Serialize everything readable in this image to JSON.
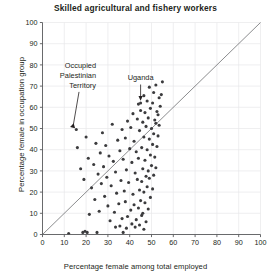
{
  "chart_data": {
    "type": "scatter",
    "title": "Skilled agricultural and fishery workers",
    "xlabel": "Percentage female among total employed",
    "ylabel": "Percentage female in occupation group",
    "xlim": [
      0,
      100
    ],
    "ylim": [
      0,
      100
    ],
    "xticks": [
      0,
      10,
      20,
      30,
      40,
      50,
      60,
      70,
      80,
      90,
      100
    ],
    "yticks": [
      0,
      10,
      20,
      30,
      40,
      50,
      60,
      70,
      80,
      90,
      100
    ],
    "grid": true,
    "legend": "none",
    "reference_line": {
      "type": "identity",
      "label": "y = x",
      "from": [
        0,
        0
      ],
      "to": [
        100,
        100
      ]
    },
    "annotations": [
      {
        "label": "Occupied Palestinian Territory",
        "lines": [
          "Occupied",
          "Palestinian",
          "Territory"
        ],
        "point": [
          15.5,
          49.5
        ],
        "leader": "arrow-down-right"
      },
      {
        "label": "Uganda",
        "lines": [
          "Uganda"
        ],
        "point": [
          45.0,
          62.0
        ],
        "leader": "arrow-down"
      }
    ],
    "points": [
      [
        15.5,
        49.5
      ],
      [
        45.0,
        62.0
      ],
      [
        12.0,
        0.5
      ],
      [
        18.5,
        1.0
      ],
      [
        19.5,
        1.5
      ],
      [
        20.5,
        1.0
      ],
      [
        25.0,
        1.0
      ],
      [
        37.0,
        1.0
      ],
      [
        33.5,
        3.5
      ],
      [
        35.5,
        4.0
      ],
      [
        38.5,
        3.0
      ],
      [
        41.0,
        5.0
      ],
      [
        42.5,
        3.5
      ],
      [
        44.5,
        4.5
      ],
      [
        46.5,
        2.5
      ],
      [
        31.0,
        6.5
      ],
      [
        36.5,
        7.5
      ],
      [
        39.0,
        8.5
      ],
      [
        43.0,
        7.0
      ],
      [
        45.5,
        9.0
      ],
      [
        47.5,
        6.0
      ],
      [
        21.5,
        9.5
      ],
      [
        26.0,
        11.0
      ],
      [
        33.0,
        10.5
      ],
      [
        40.5,
        11.5
      ],
      [
        44.0,
        12.5
      ],
      [
        46.0,
        10.0
      ],
      [
        48.5,
        12.0
      ],
      [
        30.0,
        13.5
      ],
      [
        35.0,
        14.5
      ],
      [
        38.0,
        15.5
      ],
      [
        42.0,
        14.0
      ],
      [
        45.0,
        16.0
      ],
      [
        47.0,
        15.0
      ],
      [
        49.5,
        17.5
      ],
      [
        24.0,
        16.5
      ],
      [
        28.5,
        18.0
      ],
      [
        34.0,
        19.5
      ],
      [
        37.5,
        20.5
      ],
      [
        41.5,
        19.0
      ],
      [
        44.5,
        21.0
      ],
      [
        46.5,
        20.0
      ],
      [
        48.0,
        22.5
      ],
      [
        50.5,
        21.5
      ],
      [
        22.5,
        22.0
      ],
      [
        27.0,
        24.0
      ],
      [
        31.5,
        23.0
      ],
      [
        36.0,
        25.5
      ],
      [
        39.5,
        24.5
      ],
      [
        43.5,
        26.0
      ],
      [
        45.5,
        25.0
      ],
      [
        47.5,
        27.5
      ],
      [
        49.0,
        26.5
      ],
      [
        51.0,
        28.0
      ],
      [
        19.0,
        26.0
      ],
      [
        25.5,
        28.5
      ],
      [
        29.5,
        27.0
      ],
      [
        33.5,
        29.5
      ],
      [
        38.5,
        30.5
      ],
      [
        42.5,
        29.0
      ],
      [
        46.0,
        31.0
      ],
      [
        48.5,
        30.0
      ],
      [
        50.0,
        32.5
      ],
      [
        52.0,
        31.5
      ],
      [
        17.5,
        31.0
      ],
      [
        23.5,
        33.0
      ],
      [
        28.0,
        32.0
      ],
      [
        32.5,
        34.5
      ],
      [
        37.0,
        35.5
      ],
      [
        41.0,
        34.0
      ],
      [
        44.0,
        36.0
      ],
      [
        47.0,
        35.0
      ],
      [
        49.5,
        37.5
      ],
      [
        51.5,
        36.5
      ],
      [
        21.0,
        36.0
      ],
      [
        26.5,
        38.5
      ],
      [
        30.5,
        37.0
      ],
      [
        35.5,
        39.5
      ],
      [
        40.0,
        40.5
      ],
      [
        43.0,
        39.0
      ],
      [
        45.5,
        41.0
      ],
      [
        48.0,
        40.0
      ],
      [
        50.5,
        42.5
      ],
      [
        52.5,
        41.5
      ],
      [
        16.0,
        41.0
      ],
      [
        24.5,
        43.0
      ],
      [
        29.0,
        42.0
      ],
      [
        34.5,
        44.5
      ],
      [
        38.0,
        45.5
      ],
      [
        42.0,
        44.0
      ],
      [
        46.5,
        46.0
      ],
      [
        49.0,
        45.0
      ],
      [
        51.0,
        47.5
      ],
      [
        53.0,
        46.5
      ],
      [
        20.0,
        46.0
      ],
      [
        27.5,
        48.0
      ],
      [
        36.5,
        49.5
      ],
      [
        40.5,
        50.5
      ],
      [
        44.5,
        49.0
      ],
      [
        47.5,
        51.0
      ],
      [
        50.0,
        50.0
      ],
      [
        52.0,
        52.5
      ],
      [
        53.5,
        51.5
      ],
      [
        32.0,
        52.0
      ],
      [
        39.0,
        53.5
      ],
      [
        43.5,
        54.5
      ],
      [
        46.0,
        53.0
      ],
      [
        48.5,
        55.0
      ],
      [
        51.5,
        54.0
      ],
      [
        53.0,
        56.5
      ],
      [
        41.5,
        57.0
      ],
      [
        45.0,
        58.5
      ],
      [
        47.0,
        57.5
      ],
      [
        49.5,
        59.5
      ],
      [
        52.5,
        58.0
      ],
      [
        54.0,
        60.5
      ],
      [
        44.0,
        61.5
      ],
      [
        48.0,
        63.0
      ],
      [
        50.5,
        62.0
      ],
      [
        53.5,
        64.5
      ],
      [
        46.5,
        65.5
      ],
      [
        51.0,
        67.0
      ],
      [
        54.5,
        66.0
      ],
      [
        49.0,
        69.5
      ],
      [
        52.0,
        70.5
      ],
      [
        55.0,
        72.0
      ]
    ]
  }
}
